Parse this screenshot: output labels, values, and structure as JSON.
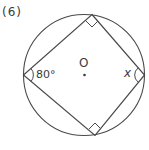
{
  "problem": {
    "number_label": "(6)"
  },
  "figure": {
    "center_label": "O",
    "given_angle_label": "80°",
    "unknown_angle_label": "x",
    "stroke_color": "#4a4a4a",
    "right_angle_marks": 2
  }
}
